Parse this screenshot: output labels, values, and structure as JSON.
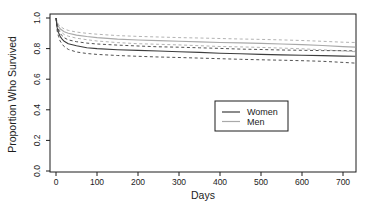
{
  "figure": {
    "background_color": "#ffffff",
    "axis_color": "#1c1c1c"
  },
  "chart_data": {
    "type": "line",
    "title": "",
    "xlabel": "Days",
    "ylabel": "Proportion Who Survived",
    "xlim": [
      0,
      730
    ],
    "ylim": [
      0.0,
      1.0
    ],
    "grid": false,
    "x_ticks": [
      0,
      100,
      200,
      300,
      400,
      500,
      600,
      700
    ],
    "x_tick_labels": [
      "0",
      "100",
      "200",
      "300",
      "400",
      "500",
      "600",
      "700"
    ],
    "y_ticks": [
      0.0,
      0.2,
      0.4,
      0.6,
      0.8,
      1.0
    ],
    "y_tick_labels": [
      "0.0",
      "0.2",
      "0.4",
      "0.6",
      "0.8",
      "1.0"
    ],
    "x": [
      0,
      3,
      6,
      10,
      15,
      20,
      30,
      50,
      75,
      100,
      150,
      200,
      250,
      300,
      350,
      400,
      450,
      500,
      550,
      600,
      650,
      700,
      730
    ],
    "series": [
      {
        "name": "Men",
        "role": "upper-ci",
        "style": "dashed",
        "color": "#a9a9a9",
        "values": [
          1.0,
          0.975,
          0.958,
          0.946,
          0.937,
          0.928,
          0.919,
          0.908,
          0.9,
          0.894,
          0.885,
          0.88,
          0.876,
          0.872,
          0.869,
          0.866,
          0.863,
          0.86,
          0.857,
          0.853,
          0.848,
          0.842,
          0.84
        ]
      },
      {
        "name": "Men",
        "role": "estimate",
        "style": "solid",
        "color": "#a9a9a9",
        "values": [
          1.0,
          0.965,
          0.945,
          0.93,
          0.92,
          0.91,
          0.9,
          0.888,
          0.879,
          0.872,
          0.862,
          0.856,
          0.852,
          0.848,
          0.844,
          0.84,
          0.837,
          0.834,
          0.83,
          0.826,
          0.82,
          0.813,
          0.81
        ]
      },
      {
        "name": "Men",
        "role": "lower-ci",
        "style": "dashed",
        "color": "#a9a9a9",
        "values": [
          1.0,
          0.955,
          0.932,
          0.914,
          0.903,
          0.892,
          0.881,
          0.868,
          0.858,
          0.85,
          0.839,
          0.832,
          0.828,
          0.824,
          0.819,
          0.814,
          0.811,
          0.808,
          0.803,
          0.799,
          0.792,
          0.784,
          0.78
        ]
      },
      {
        "name": "Women",
        "role": "upper-ci",
        "style": "dashed",
        "color": "#3d3d3d",
        "values": [
          1.0,
          0.95,
          0.923,
          0.9,
          0.884,
          0.871,
          0.857,
          0.845,
          0.836,
          0.83,
          0.823,
          0.817,
          0.812,
          0.809,
          0.805,
          0.801,
          0.797,
          0.794,
          0.791,
          0.789,
          0.787,
          0.786,
          0.785
        ]
      },
      {
        "name": "Women",
        "role": "estimate",
        "style": "solid",
        "color": "#3d3d3d",
        "values": [
          1.0,
          0.935,
          0.905,
          0.88,
          0.862,
          0.848,
          0.832,
          0.818,
          0.805,
          0.8,
          0.793,
          0.788,
          0.784,
          0.78,
          0.775,
          0.77,
          0.766,
          0.762,
          0.759,
          0.757,
          0.754,
          0.751,
          0.75
        ]
      },
      {
        "name": "Women",
        "role": "lower-ci",
        "style": "dashed",
        "color": "#3d3d3d",
        "values": [
          1.0,
          0.915,
          0.88,
          0.85,
          0.83,
          0.813,
          0.795,
          0.778,
          0.768,
          0.762,
          0.755,
          0.75,
          0.745,
          0.742,
          0.738,
          0.734,
          0.73,
          0.727,
          0.724,
          0.721,
          0.717,
          0.71,
          0.705
        ]
      }
    ],
    "legend": {
      "position": "center-right",
      "entries": [
        {
          "label": "Women",
          "color": "#3d3d3d",
          "style": "solid"
        },
        {
          "label": "Men",
          "color": "#a9a9a9",
          "style": "solid"
        }
      ]
    }
  }
}
